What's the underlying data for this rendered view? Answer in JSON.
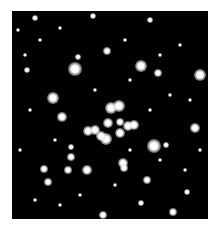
{
  "image": {
    "description": "Star cluster photograph",
    "background": "#000000",
    "star_color": "#ffffff"
  },
  "stars": [
    {
      "x": 75,
      "y": 69,
      "r": 6
    },
    {
      "x": 141,
      "y": 66,
      "r": 5
    },
    {
      "x": 200,
      "y": 75,
      "r": 5
    },
    {
      "x": 53,
      "y": 98,
      "r": 5
    },
    {
      "x": 111,
      "y": 108,
      "r": 5
    },
    {
      "x": 119,
      "y": 106,
      "r": 5
    },
    {
      "x": 62,
      "y": 117,
      "r": 4
    },
    {
      "x": 108,
      "y": 123,
      "r": 4
    },
    {
      "x": 120,
      "y": 122,
      "r": 3
    },
    {
      "x": 128,
      "y": 126,
      "r": 4
    },
    {
      "x": 134,
      "y": 125,
      "r": 4
    },
    {
      "x": 88,
      "y": 131,
      "r": 4
    },
    {
      "x": 95,
      "y": 130,
      "r": 4
    },
    {
      "x": 106,
      "y": 139,
      "r": 5
    },
    {
      "x": 101,
      "y": 136,
      "r": 4
    },
    {
      "x": 120,
      "y": 133,
      "r": 4
    },
    {
      "x": 154,
      "y": 146,
      "r": 6
    },
    {
      "x": 195,
      "y": 128,
      "r": 4
    },
    {
      "x": 123,
      "y": 163,
      "r": 4
    },
    {
      "x": 124,
      "y": 168,
      "r": 3
    },
    {
      "x": 44,
      "y": 169,
      "r": 3
    },
    {
      "x": 87,
      "y": 170,
      "r": 4
    },
    {
      "x": 68,
      "y": 170,
      "r": 3
    },
    {
      "x": 48,
      "y": 182,
      "r": 3
    },
    {
      "x": 158,
      "y": 73,
      "r": 3
    },
    {
      "x": 107,
      "y": 51,
      "r": 3
    },
    {
      "x": 27,
      "y": 70,
      "r": 2
    },
    {
      "x": 35,
      "y": 18,
      "r": 2
    },
    {
      "x": 93,
      "y": 16,
      "r": 2
    },
    {
      "x": 150,
      "y": 20,
      "r": 2
    },
    {
      "x": 103,
      "y": 215,
      "r": 3
    },
    {
      "x": 173,
      "y": 212,
      "r": 3
    },
    {
      "x": 147,
      "y": 180,
      "r": 3
    },
    {
      "x": 187,
      "y": 192,
      "r": 2
    },
    {
      "x": 141,
      "y": 203,
      "r": 2
    },
    {
      "x": 71,
      "y": 157,
      "r": 3
    },
    {
      "x": 71,
      "y": 147,
      "r": 2
    },
    {
      "x": 166,
      "y": 145,
      "r": 2
    },
    {
      "x": 78,
      "y": 57,
      "r": 2
    },
    {
      "x": 18,
      "y": 30,
      "r": 1
    },
    {
      "x": 25,
      "y": 55,
      "r": 1
    },
    {
      "x": 40,
      "y": 40,
      "r": 1
    },
    {
      "x": 60,
      "y": 28,
      "r": 1
    },
    {
      "x": 125,
      "y": 40,
      "r": 1
    },
    {
      "x": 160,
      "y": 55,
      "r": 1
    },
    {
      "x": 180,
      "y": 45,
      "r": 1
    },
    {
      "x": 190,
      "y": 100,
      "r": 1
    },
    {
      "x": 170,
      "y": 95,
      "r": 1
    },
    {
      "x": 30,
      "y": 110,
      "r": 1
    },
    {
      "x": 20,
      "y": 150,
      "r": 1
    },
    {
      "x": 35,
      "y": 200,
      "r": 1
    },
    {
      "x": 60,
      "y": 205,
      "r": 1
    },
    {
      "x": 80,
      "y": 195,
      "r": 1
    },
    {
      "x": 115,
      "y": 185,
      "r": 1
    },
    {
      "x": 160,
      "y": 160,
      "r": 1
    },
    {
      "x": 185,
      "y": 170,
      "r": 1
    },
    {
      "x": 200,
      "y": 150,
      "r": 1
    },
    {
      "x": 130,
      "y": 80,
      "r": 1
    },
    {
      "x": 95,
      "y": 90,
      "r": 1
    },
    {
      "x": 150,
      "y": 110,
      "r": 1
    },
    {
      "x": 55,
      "y": 140,
      "r": 1
    },
    {
      "x": 130,
      "y": 150,
      "r": 1
    }
  ]
}
